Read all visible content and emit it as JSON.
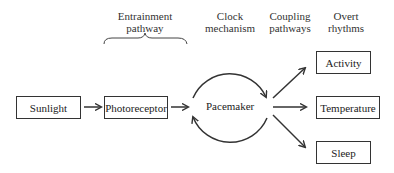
{
  "headers": {
    "entrainment": [
      "Entrainment",
      "pathway"
    ],
    "clock": [
      "Clock",
      "mechanism"
    ],
    "coupling": [
      "Coupling",
      "pathways"
    ],
    "overt": [
      "Overt",
      "rhythms"
    ]
  },
  "nodes": {
    "sunlight": "Sunlight",
    "photoreceptor": "Photoreceptor",
    "pacemaker": "Pacemaker",
    "activity": "Activity",
    "temperature": "Temperature",
    "sleep": "Sleep"
  },
  "edges": [
    {
      "from": "Sunlight",
      "to": "Photoreceptor"
    },
    {
      "from": "Photoreceptor",
      "to": "Pacemaker"
    },
    {
      "from": "Pacemaker",
      "to": "Pacemaker",
      "type": "self-loop cycle"
    },
    {
      "from": "Pacemaker",
      "to": "Activity"
    },
    {
      "from": "Pacemaker",
      "to": "Temperature"
    },
    {
      "from": "Pacemaker",
      "to": "Sleep"
    }
  ],
  "colors": {
    "stroke": "#333333",
    "background": "#ffffff"
  }
}
